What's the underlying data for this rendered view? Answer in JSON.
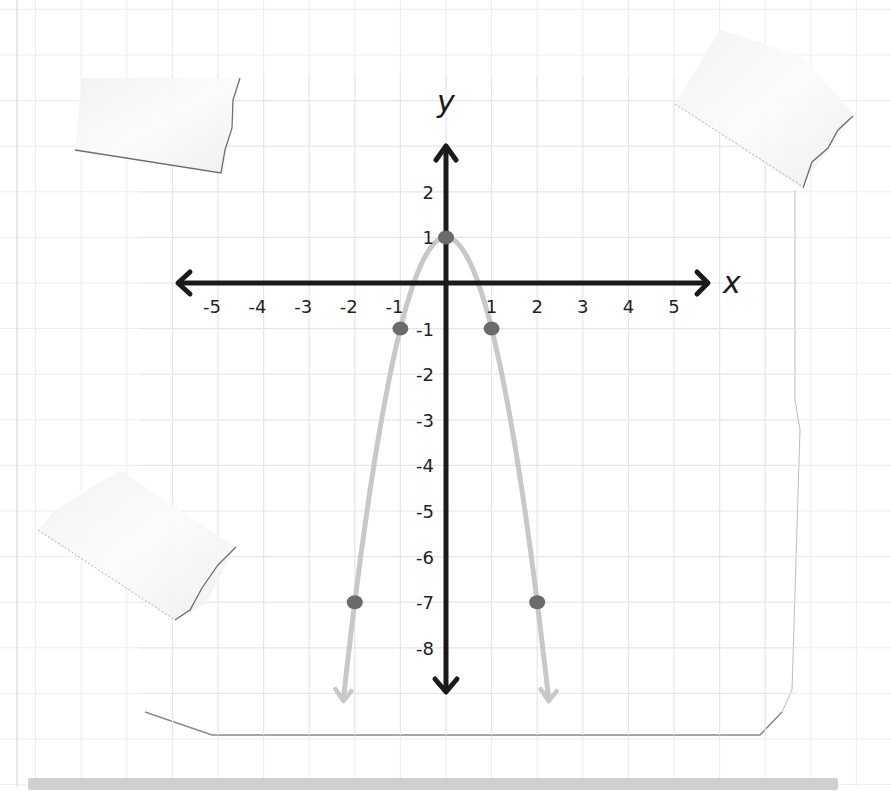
{
  "chart_data": {
    "type": "line",
    "title": "",
    "equation": "y = -2x^2 + 1",
    "xlabel": "x",
    "ylabel": "y",
    "xlim": [
      -5,
      5
    ],
    "ylim": [
      -8,
      2
    ],
    "grid": true,
    "x_tick_labels": [
      "-5",
      "-4",
      "-3",
      "-2",
      "-1",
      "1",
      "2",
      "3",
      "4",
      "5"
    ],
    "y_tick_labels": [
      "2",
      "1",
      "-1",
      "-2",
      "-3",
      "-4",
      "-5",
      "-6",
      "-7",
      "-8"
    ],
    "series": [
      {
        "name": "parabola",
        "color": "#c8c8c8",
        "x": [
          -2,
          -1,
          0,
          1,
          2
        ],
        "y": [
          -7,
          -1,
          1,
          -1,
          -7
        ]
      }
    ],
    "points": [
      {
        "x": -2,
        "y": -7
      },
      {
        "x": -1,
        "y": -1
      },
      {
        "x": 0,
        "y": 1
      },
      {
        "x": 1,
        "y": -1
      },
      {
        "x": 2,
        "y": -7
      }
    ],
    "colors": {
      "axis": "#1a1a1a",
      "curve": "#c8c8c8",
      "point": "#6b6b6b",
      "grid": "#e6e6e6",
      "paper_edge": "#7a7a7a"
    }
  }
}
